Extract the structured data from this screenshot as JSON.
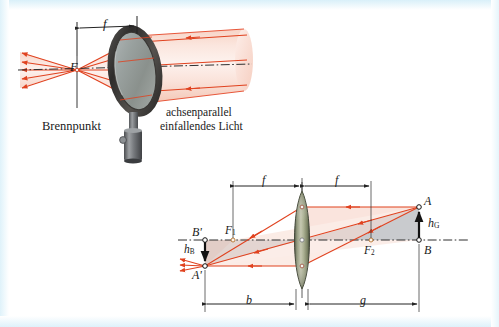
{
  "figure": {
    "kind": "optics-figure",
    "background_color": "#ffffff",
    "border_color": "#e2f4fb",
    "ray_color": "#e8492a",
    "ray_fill_color": "#f9d9cf",
    "axis_color": "#2a2a2a",
    "shade_color": "#c3c6c9",
    "lens_color": "#8d9470",
    "metal_color": "#6d6f73"
  },
  "top_panel": {
    "name": "magnifier-focal-point-diagram",
    "dimension_f": "f",
    "focal_point_symbol": "F",
    "focal_point_label": "Brennpunkt",
    "beam_label_line1": "achsenparallel",
    "beam_label_line2": "einfallendes Licht",
    "icons": {
      "magnifier": "magnifier-lens-icon",
      "stand": "lens-stand-icon",
      "beam": "parallel-light-beam-icon",
      "axis": "optical-axis-icon"
    }
  },
  "bottom_panel": {
    "name": "thin-lens-imaging-diagram",
    "dimension_f_left": "f",
    "dimension_f_right": "f",
    "dimension_b": "b",
    "dimension_g": "g",
    "object_top": "A",
    "object_base": "B",
    "object_height": "h",
    "object_height_sub": "G",
    "image_top": "A'",
    "image_base": "B'",
    "image_height": "h",
    "image_height_sub": "B",
    "focal_left": "F",
    "focal_left_sub": "1",
    "focal_right": "F",
    "focal_right_sub": "2",
    "icons": {
      "lens": "biconvex-lens-icon",
      "axis": "optical-axis-icon",
      "object_arrow": "object-arrow-icon",
      "image_arrow": "image-arrow-icon"
    }
  }
}
